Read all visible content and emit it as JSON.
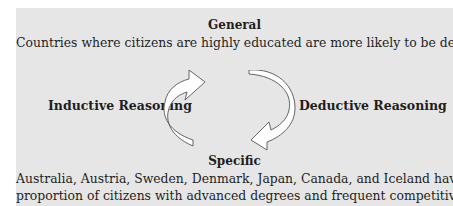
{
  "diagram": {
    "general": {
      "heading": "General",
      "statement": "Countries where citizens are highly educated are more likely to be democracies."
    },
    "inductive": {
      "label": "Inductive Reasoning",
      "direction": "up",
      "icon": "curved-arrow-up-icon"
    },
    "deductive": {
      "label": "Deductive Reasoning",
      "direction": "down",
      "icon": "curved-arrow-down-icon"
    },
    "specific": {
      "heading": "Specific",
      "line1": "Australia, Austria, Sweden, Denmark, Japan, Canada, and Iceland have a high",
      "line2": "proportion of citizens with advanced degrees and frequent competitive elections."
    },
    "colors": {
      "panel_background": "#e6e6e6",
      "text": "#1e1e1e",
      "arrow_fill": "#ffffff",
      "arrow_stroke": "#555555"
    }
  }
}
